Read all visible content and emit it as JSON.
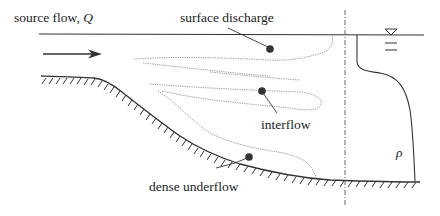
{
  "diagram": {
    "type": "stratified reservoir inflow schematic",
    "labels": {
      "source_flow": "source flow, ",
      "source_symbol": "Q",
      "surface_discharge": "surface discharge",
      "interflow": "interflow",
      "dense_underflow": "dense underflow",
      "density_symbol": "ρ"
    },
    "elements": [
      "water-surface-line",
      "inflow-arrow",
      "sloping-bed-with-hatching",
      "surface-discharge-plume",
      "interflow-plume",
      "underflow-plume",
      "vertical-dash-dot-profile-line",
      "free-surface-triangle-symbol",
      "density-profile-curve"
    ],
    "colors": {
      "ink": "#333333",
      "plume_outline": "#9a9a9a",
      "dot": "#333333"
    }
  }
}
